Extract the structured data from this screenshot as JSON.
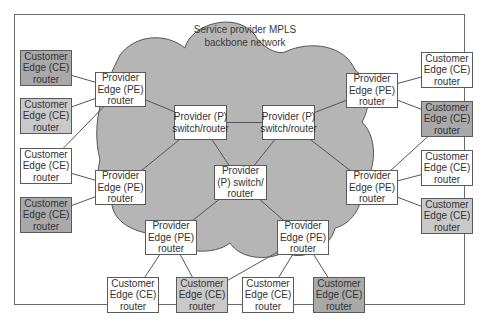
{
  "title": "Service provider MPLS backbone network",
  "cloud": {
    "label_lines": [
      "Service provider MPLS",
      "backbone network"
    ],
    "fill": "#b5b5b5",
    "stroke": "#555555"
  },
  "colors": {
    "box_white": "#ffffff",
    "box_light": "#c9c9c9",
    "box_dark": "#a9a9a9",
    "link": "#555555"
  },
  "nodes": [
    {
      "id": "ce-l1",
      "type": "CE",
      "shade": "dark",
      "lines": [
        "Customer",
        "Edge (CE)",
        "router"
      ]
    },
    {
      "id": "ce-l2",
      "type": "CE",
      "shade": "light",
      "lines": [
        "Customer",
        "Edge (CE)",
        "router"
      ]
    },
    {
      "id": "ce-l3",
      "type": "CE",
      "shade": "white",
      "lines": [
        "Customer",
        "Edge (CE)",
        "router"
      ]
    },
    {
      "id": "ce-l4",
      "type": "CE",
      "shade": "dark",
      "lines": [
        "Customer",
        "Edge (CE)",
        "router"
      ]
    },
    {
      "id": "pe-l1",
      "type": "PE",
      "shade": "white",
      "lines": [
        "Provider",
        "Edge (PE)",
        "router"
      ]
    },
    {
      "id": "pe-l2",
      "type": "PE",
      "shade": "white",
      "lines": [
        "Provider",
        "Edge (PE)",
        "router"
      ]
    },
    {
      "id": "p-1",
      "type": "P",
      "shade": "white",
      "lines": [
        "Provider (P)",
        "switch/router"
      ]
    },
    {
      "id": "p-2",
      "type": "P",
      "shade": "white",
      "lines": [
        "Provider (P)",
        "switch/router"
      ]
    },
    {
      "id": "p-3",
      "type": "P",
      "shade": "white",
      "lines": [
        "Provider",
        "(P) switch/",
        "router"
      ]
    },
    {
      "id": "pe-b1",
      "type": "PE",
      "shade": "white",
      "lines": [
        "Provider",
        "Edge (PE)",
        "router"
      ]
    },
    {
      "id": "pe-b2",
      "type": "PE",
      "shade": "white",
      "lines": [
        "Provider",
        "Edge (PE)",
        "router"
      ]
    },
    {
      "id": "pe-r1",
      "type": "PE",
      "shade": "white",
      "lines": [
        "Provider",
        "Edge (PE)",
        "router"
      ]
    },
    {
      "id": "pe-r2",
      "type": "PE",
      "shade": "white",
      "lines": [
        "Provider",
        "Edge (PE)",
        "router"
      ]
    },
    {
      "id": "ce-r1",
      "type": "CE",
      "shade": "white",
      "lines": [
        "Customer",
        "Edge (CE)",
        "router"
      ]
    },
    {
      "id": "ce-r2",
      "type": "CE",
      "shade": "dark",
      "lines": [
        "Customer",
        "Edge (CE)",
        "router"
      ]
    },
    {
      "id": "ce-r3",
      "type": "CE",
      "shade": "white",
      "lines": [
        "Customer",
        "Edge (CE)",
        "router"
      ]
    },
    {
      "id": "ce-r4",
      "type": "CE",
      "shade": "light",
      "lines": [
        "Customer",
        "Edge (CE)",
        "router"
      ]
    },
    {
      "id": "ce-b1",
      "type": "CE",
      "shade": "white",
      "lines": [
        "Customer",
        "Edge (CE)",
        "router"
      ]
    },
    {
      "id": "ce-b2",
      "type": "CE",
      "shade": "light",
      "lines": [
        "Customer",
        "Edge (CE)",
        "router"
      ]
    },
    {
      "id": "ce-b3",
      "type": "CE",
      "shade": "white",
      "lines": [
        "Customer",
        "Edge (CE)",
        "router"
      ]
    },
    {
      "id": "ce-b4",
      "type": "CE",
      "shade": "dark",
      "lines": [
        "Customer",
        "Edge (CE)",
        "router"
      ]
    }
  ],
  "links": [
    [
      "ce-l1",
      "pe-l1"
    ],
    [
      "ce-l2",
      "pe-l1"
    ],
    [
      "ce-l3",
      "pe-l1"
    ],
    [
      "ce-l3",
      "pe-l2"
    ],
    [
      "ce-l4",
      "pe-l2"
    ],
    [
      "pe-l1",
      "p-1"
    ],
    [
      "pe-l2",
      "p-1"
    ],
    [
      "p-1",
      "p-2"
    ],
    [
      "p-1",
      "p-3"
    ],
    [
      "p-2",
      "p-3"
    ],
    [
      "p-2",
      "pe-r1"
    ],
    [
      "p-2",
      "pe-r2"
    ],
    [
      "p-3",
      "pe-b1"
    ],
    [
      "p-3",
      "pe-b2"
    ],
    [
      "pe-r1",
      "ce-r1"
    ],
    [
      "pe-r1",
      "ce-r2"
    ],
    [
      "pe-r2",
      "ce-r2"
    ],
    [
      "pe-r2",
      "ce-r3"
    ],
    [
      "pe-r2",
      "ce-r4"
    ],
    [
      "pe-b1",
      "ce-b1"
    ],
    [
      "pe-b1",
      "ce-b2"
    ],
    [
      "pe-b2",
      "ce-b2"
    ],
    [
      "pe-b2",
      "ce-b3"
    ],
    [
      "pe-b2",
      "ce-b4"
    ]
  ]
}
